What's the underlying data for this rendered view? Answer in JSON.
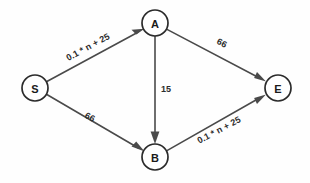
{
  "diagram": {
    "background_color": "#fefefe",
    "node_stroke_color": "#2b2b2b",
    "edge_stroke_color": "#4a4a4a",
    "label_color": "#2d2d2d",
    "nodes": [
      {
        "id": "S",
        "label": "S",
        "cx": 35,
        "cy": 88,
        "r": 13
      },
      {
        "id": "A",
        "label": "A",
        "cx": 155,
        "cy": 23,
        "r": 13
      },
      {
        "id": "B",
        "label": "B",
        "cx": 155,
        "cy": 157,
        "r": 13
      },
      {
        "id": "E",
        "label": "E",
        "cx": 278,
        "cy": 88,
        "r": 13
      }
    ],
    "edges": [
      {
        "id": "s-a",
        "from": "S",
        "to": "A",
        "weight_label": "0.1 * n + 25",
        "label_x": 88,
        "label_y": 47,
        "label_rotation": -28.4
      },
      {
        "id": "a-e",
        "from": "A",
        "to": "E",
        "weight_label": "66",
        "label_x": 222,
        "label_y": 43,
        "label_rotation": 27.8
      },
      {
        "id": "a-b",
        "from": "A",
        "to": "B",
        "weight_label": "15",
        "label_x": 166,
        "label_y": 89,
        "label_rotation": 0
      },
      {
        "id": "s-b",
        "from": "S",
        "to": "B",
        "weight_label": "66",
        "label_x": 90,
        "label_y": 117,
        "label_rotation": 28.4
      },
      {
        "id": "b-e",
        "from": "B",
        "to": "E",
        "weight_label": "0.1 * n + 25",
        "label_x": 219,
        "label_y": 130,
        "label_rotation": -27.8
      }
    ]
  }
}
